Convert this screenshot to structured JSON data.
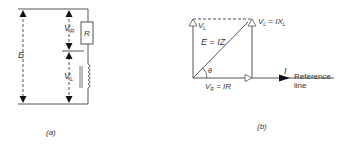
{
  "figure_a": {
    "caption": "(a)",
    "labels": {
      "E": "E",
      "VR_main": "V",
      "VR_sub": "R",
      "VL_main": "V",
      "VL_sub": "L",
      "R": "R"
    }
  },
  "figure_b": {
    "caption": "(b)",
    "labels": {
      "VL_top_main": "V",
      "VL_top_sub": "L",
      "VL_right": "V",
      "VL_right_sub": "L",
      "VL_right_eq": " = IX",
      "VL_right_eq_sub": "L",
      "E_eq": "E = IZ",
      "theta": "θ",
      "VR_main": "V",
      "VR_sub": "R",
      "VR_eq": " = IR",
      "I": "I",
      "reference_line_1": "Reference",
      "reference_line_2": "line"
    }
  },
  "colors": {
    "stroke": "#555555",
    "text": "#333333",
    "arrow_fill": "#111111"
  }
}
